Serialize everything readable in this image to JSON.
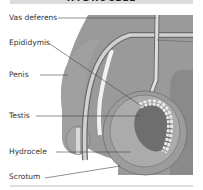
{
  "title": "HYDROCELE",
  "labels": [
    {
      "id": "vas-deferens",
      "text": "Vas deferens"
    },
    {
      "id": "epididymis",
      "text": "Epididymis"
    },
    {
      "id": "penis",
      "text": "Penis"
    },
    {
      "id": "testis",
      "text": "Testis"
    },
    {
      "id": "hydrocele",
      "text": "Hydrocele"
    },
    {
      "id": "scrotum",
      "text": "Scrotum"
    }
  ],
  "colors": {
    "tissue": "#9a9a9a",
    "tissue_dark": "#7f7f7f",
    "light_tube": "#d6d6d6",
    "testis": "#6e6e6e",
    "fluid": "#a8a8a8",
    "leader_line": "#444444",
    "title_bg": "#dcdcdc"
  }
}
